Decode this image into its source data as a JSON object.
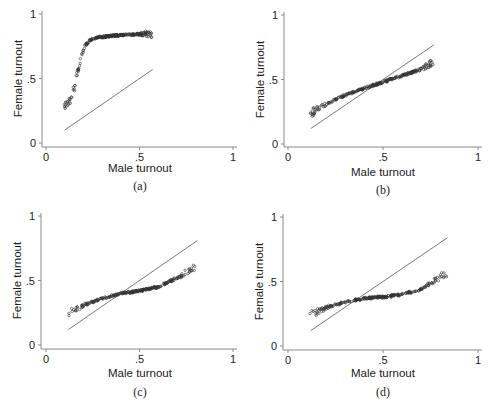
{
  "figure": {
    "panels": [
      "(a)",
      "(b)",
      "(c)",
      "(d)"
    ]
  },
  "chart_data": [
    {
      "type": "scatter",
      "panel_label": "(a)",
      "xlabel": "Male turnout",
      "ylabel": "Female turnout",
      "xticks": [
        "0",
        ".5",
        "1"
      ],
      "yticks": [
        "0",
        ".5",
        "1"
      ],
      "xlim": [
        0,
        1
      ],
      "ylim": [
        0,
        1
      ],
      "reference_line": {
        "x": [
          0.1,
          0.57
        ],
        "y": [
          0.1,
          0.57
        ]
      },
      "trend": {
        "x": [
          0.1,
          0.13,
          0.15,
          0.17,
          0.19,
          0.21,
          0.24,
          0.28,
          0.35,
          0.45,
          0.57
        ],
        "y": [
          0.27,
          0.33,
          0.42,
          0.55,
          0.68,
          0.76,
          0.8,
          0.82,
          0.83,
          0.84,
          0.85
        ]
      }
    },
    {
      "type": "scatter",
      "panel_label": "(b)",
      "xlabel": "Male turnout",
      "ylabel": "Female turnout",
      "xticks": [
        "0",
        ".5",
        "1"
      ],
      "yticks": [
        "0",
        ".5",
        "1"
      ],
      "xlim": [
        0,
        1
      ],
      "ylim": [
        0,
        1
      ],
      "reference_line": {
        "x": [
          0.12,
          0.77
        ],
        "y": [
          0.12,
          0.77
        ]
      },
      "trend": {
        "x": [
          0.12,
          0.2,
          0.3,
          0.4,
          0.5,
          0.6,
          0.7,
          0.77
        ],
        "y": [
          0.24,
          0.31,
          0.38,
          0.43,
          0.48,
          0.53,
          0.58,
          0.64
        ]
      }
    },
    {
      "type": "scatter",
      "panel_label": "(c)",
      "xlabel": "Male turnout",
      "ylabel": "Female turnout",
      "xticks": [
        "0",
        ".5",
        "1"
      ],
      "yticks": [
        "0",
        ".5",
        "1"
      ],
      "xlim": [
        0,
        1
      ],
      "ylim": [
        0,
        1
      ],
      "reference_line": {
        "x": [
          0.12,
          0.81
        ],
        "y": [
          0.12,
          0.81
        ]
      },
      "trend": {
        "x": [
          0.12,
          0.2,
          0.3,
          0.4,
          0.5,
          0.6,
          0.7,
          0.8
        ],
        "y": [
          0.24,
          0.31,
          0.36,
          0.4,
          0.42,
          0.45,
          0.52,
          0.6
        ]
      }
    },
    {
      "type": "scatter",
      "panel_label": "(d)",
      "xlabel": "Male turnout",
      "ylabel": "Female turnout",
      "xticks": [
        "0",
        ".5",
        "1"
      ],
      "yticks": [
        "0",
        ".5",
        "1"
      ],
      "xlim": [
        0,
        1
      ],
      "ylim": [
        0,
        1
      ],
      "reference_line": {
        "x": [
          0.12,
          0.84
        ],
        "y": [
          0.12,
          0.84
        ]
      },
      "trend": {
        "x": [
          0.12,
          0.2,
          0.3,
          0.4,
          0.5,
          0.6,
          0.7,
          0.8,
          0.84
        ],
        "y": [
          0.24,
          0.3,
          0.34,
          0.37,
          0.38,
          0.4,
          0.44,
          0.53,
          0.58
        ]
      }
    }
  ]
}
